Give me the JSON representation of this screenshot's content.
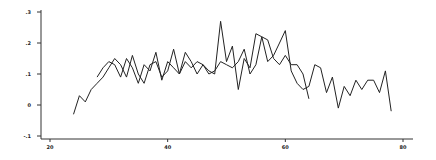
{
  "chart_data": {
    "type": "line",
    "title": "",
    "xlabel": "",
    "ylabel": "",
    "xlim": [
      18,
      82
    ],
    "ylim": [
      -0.11,
      0.32
    ],
    "grid": false,
    "legend": null,
    "x_ticks": [
      20,
      40,
      60,
      80
    ],
    "x_tick_labels": [
      "20",
      "40",
      "60",
      "80"
    ],
    "y_ticks": [
      -0.1,
      0,
      0.1,
      0.2,
      0.3
    ],
    "y_tick_labels": [
      "-.1",
      "0",
      ".1",
      ".2",
      ".3"
    ],
    "series": [
      {
        "name": "series-1",
        "x": [
          24,
          25,
          26,
          27,
          28,
          29,
          30,
          31,
          32,
          33,
          34,
          35,
          36,
          37,
          38,
          39,
          40,
          41,
          42,
          43,
          44,
          45,
          46,
          47,
          48,
          49,
          50,
          51,
          52,
          53,
          54,
          55,
          56,
          57,
          58,
          59,
          60,
          61,
          62,
          63,
          64
        ],
        "values": [
          -0.03,
          0.03,
          0.01,
          0.05,
          0.07,
          0.09,
          0.12,
          0.15,
          0.13,
          0.09,
          0.16,
          0.1,
          0.07,
          0.13,
          0.14,
          0.09,
          0.11,
          0.18,
          0.1,
          0.14,
          0.12,
          0.14,
          0.13,
          0.1,
          0.11,
          0.14,
          0.13,
          0.12,
          0.14,
          0.18,
          0.1,
          0.13,
          0.22,
          0.21,
          0.15,
          0.13,
          0.16,
          0.13,
          0.13,
          0.1,
          0.02
        ]
      },
      {
        "name": "series-2",
        "x": [
          28,
          29,
          30,
          31,
          32,
          33,
          34,
          35,
          36,
          37,
          38,
          39,
          40,
          41,
          42,
          43,
          44,
          45,
          46,
          47,
          48,
          49,
          50,
          51,
          52,
          53,
          54,
          55,
          56,
          57,
          58,
          59,
          60,
          61,
          62,
          63,
          64,
          65,
          66,
          67,
          68,
          69,
          70,
          71,
          72,
          73,
          74,
          75,
          76,
          77,
          78
        ],
        "values": [
          0.09,
          0.12,
          0.14,
          0.13,
          0.09,
          0.15,
          0.12,
          0.07,
          0.13,
          0.11,
          0.17,
          0.08,
          0.14,
          0.12,
          0.1,
          0.17,
          0.14,
          0.1,
          0.13,
          0.11,
          0.1,
          0.27,
          0.14,
          0.19,
          0.05,
          0.15,
          0.12,
          0.23,
          0.22,
          0.14,
          0.16,
          0.2,
          0.24,
          0.11,
          0.07,
          0.05,
          0.06,
          0.13,
          0.12,
          0.04,
          0.09,
          -0.01,
          0.06,
          0.03,
          0.08,
          0.05,
          0.08,
          0.08,
          0.04,
          0.11,
          -0.02
        ]
      }
    ]
  }
}
